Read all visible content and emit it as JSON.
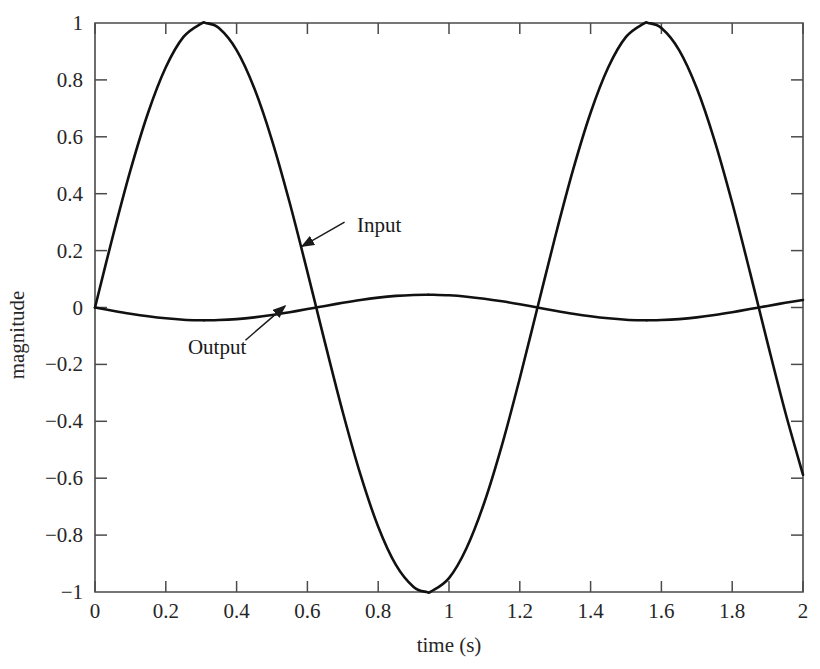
{
  "chart_data": {
    "type": "line",
    "title": "",
    "subtitle": "",
    "xlabel": "time (s)",
    "ylabel": "magnitude",
    "xlim": [
      0,
      2
    ],
    "ylim": [
      -1,
      1
    ],
    "grid": false,
    "legend_position": "inline-annotations",
    "xticks": [
      0,
      0.2,
      0.4,
      0.6,
      0.8,
      1,
      1.2,
      1.4,
      1.6,
      1.8,
      2
    ],
    "xtick_labels": [
      "0",
      "0.2",
      "0.4",
      "0.6",
      "0.8",
      "1",
      "1.2",
      "1.4",
      "1.6",
      "1.8",
      "2"
    ],
    "yticks": [
      -1,
      -0.8,
      -0.6,
      -0.4,
      -0.2,
      0,
      0.2,
      0.4,
      0.6,
      0.8,
      1
    ],
    "ytick_labels": [
      "-1",
      "-0.8",
      "-0.6",
      "-0.4",
      "-0.2",
      "0",
      "0.2",
      "0.4",
      "0.6",
      "0.8",
      "1"
    ],
    "line_color": "#111111",
    "line_width": 2.6,
    "background_color": "#ffffff",
    "annotations": [
      {
        "name": "input-annotation",
        "text": "Input",
        "label_x": 0.74,
        "label_y": 0.265,
        "arrow_from_x": 0.705,
        "arrow_from_y": 0.3,
        "arrow_to_x": 0.585,
        "arrow_to_y": 0.215
      },
      {
        "name": "output-annotation",
        "text": "Output",
        "label_x": 0.345,
        "label_y": -0.165,
        "arrow_from_x": 0.425,
        "arrow_from_y": -0.115,
        "arrow_to_x": 0.537,
        "arrow_to_y": 0.005
      }
    ],
    "series": [
      {
        "name": "Input",
        "description": "Sinusoidal input, unit amplitude, frequency 0.8 Hz",
        "amplitude": 1.0,
        "frequency_hz": 0.8,
        "x": [
          0.0,
          0.05,
          0.1,
          0.15,
          0.2,
          0.25,
          0.3,
          0.3125,
          0.35,
          0.4,
          0.45,
          0.5,
          0.55,
          0.6,
          0.625,
          0.65,
          0.7,
          0.75,
          0.8,
          0.85,
          0.9,
          0.9375,
          0.95,
          1.0,
          1.05,
          1.1,
          1.15,
          1.2,
          1.25,
          1.3,
          1.35,
          1.4,
          1.45,
          1.5,
          1.55,
          1.5625,
          1.6,
          1.65,
          1.7,
          1.75,
          1.8,
          1.85,
          1.875,
          1.9,
          1.95,
          2.0
        ],
        "values": [
          0.0,
          0.2487,
          0.4818,
          0.6845,
          0.8443,
          0.9511,
          0.998,
          1.0,
          0.9823,
          0.9048,
          0.7705,
          0.5878,
          0.3681,
          0.1253,
          0.0,
          -0.1253,
          -0.3681,
          -0.5878,
          -0.7705,
          -0.9048,
          -0.9823,
          -1.0,
          -0.998,
          -0.9511,
          -0.8443,
          -0.6845,
          -0.4818,
          -0.2487,
          0.0,
          0.2487,
          0.4818,
          0.6845,
          0.8443,
          0.9511,
          0.998,
          1.0,
          0.9823,
          0.9048,
          0.7705,
          0.5878,
          0.3681,
          0.1253,
          0.0,
          -0.1253,
          -0.3681,
          -0.5878
        ]
      },
      {
        "name": "Output",
        "description": "Attenuated, phase-shifted output; amplitude about 0.045",
        "amplitude": 0.045,
        "frequency_hz": 0.8,
        "x": [
          0.0,
          0.05,
          0.1,
          0.15,
          0.2,
          0.25,
          0.3,
          0.3125,
          0.35,
          0.4,
          0.45,
          0.5,
          0.55,
          0.6,
          0.625,
          0.65,
          0.7,
          0.75,
          0.8,
          0.85,
          0.9,
          0.9375,
          0.95,
          1.0,
          1.05,
          1.1,
          1.15,
          1.2,
          1.25,
          1.3,
          1.35,
          1.4,
          1.45,
          1.5,
          1.55,
          1.5625,
          1.6,
          1.65,
          1.7,
          1.75,
          1.8,
          1.85,
          1.875,
          1.9,
          1.95,
          2.0
        ],
        "values": [
          0.0,
          -0.0112,
          -0.0217,
          -0.0308,
          -0.038,
          -0.0428,
          -0.0449,
          -0.045,
          -0.0442,
          -0.0407,
          -0.0347,
          -0.0265,
          -0.0166,
          -0.0056,
          0.0,
          0.0056,
          0.0166,
          0.0265,
          0.0347,
          0.0407,
          0.0442,
          0.045,
          0.0449,
          0.0428,
          0.038,
          0.0308,
          0.0217,
          0.0112,
          0.0,
          -0.0112,
          -0.0217,
          -0.0308,
          -0.038,
          -0.0428,
          -0.0449,
          -0.045,
          -0.0442,
          -0.0407,
          -0.0347,
          -0.0265,
          -0.0166,
          -0.0056,
          0.0,
          0.0056,
          0.0166,
          0.0265
        ]
      }
    ]
  }
}
